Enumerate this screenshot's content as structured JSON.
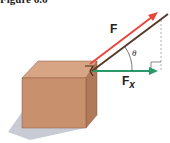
{
  "caption": "Figure 6.6",
  "labels": {
    "force": "F",
    "component": "F",
    "component_sub": "x",
    "angle": "θ"
  },
  "colors": {
    "force_arrow": "#e8463c",
    "rope": "#5a3a2a",
    "component_arrow": "#2a9a6a",
    "box_front": "#c9906e",
    "box_top": "#d8a584",
    "box_side": "#b07a5a",
    "shadow": "#9aa0b0",
    "dashed": "#999999"
  }
}
